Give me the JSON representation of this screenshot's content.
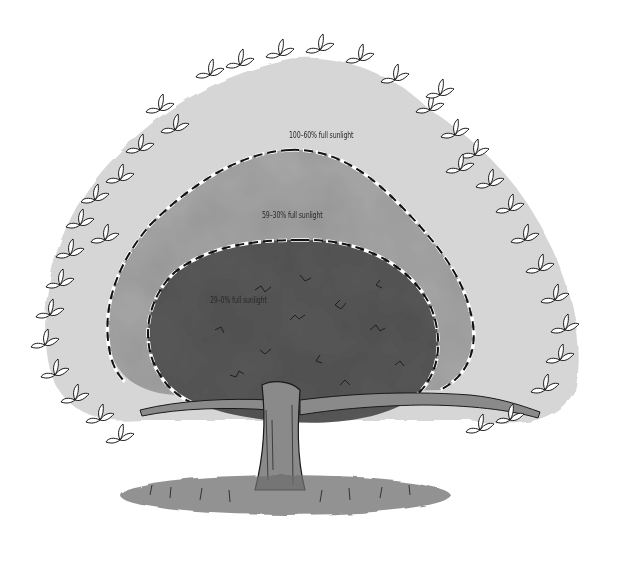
{
  "diagram": {
    "zones": [
      {
        "id": "outer",
        "label": "100–60% full sunlight",
        "fill": "#d6d6d6"
      },
      {
        "id": "middle",
        "label": "59–30% full sunlight",
        "fill": "#a9a9a9"
      },
      {
        "id": "inner",
        "label": "29–0% full sunlight",
        "fill": "#5a5a5a"
      }
    ],
    "colors": {
      "background": "#ffffff",
      "outline": "#111111",
      "trunk": "#8a8a8a",
      "ground": "#6e6e6e",
      "leaf_stroke": "#1a1a1a"
    }
  }
}
